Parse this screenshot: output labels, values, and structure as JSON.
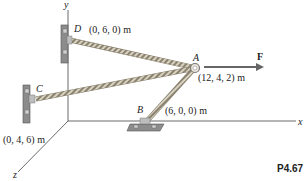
{
  "diagram": {
    "problem_number": "P4.67",
    "axes": {
      "x": "x",
      "y": "y",
      "z": "z"
    },
    "points": {
      "A": {
        "label": "A",
        "coords": "(12, 4, 2) m"
      },
      "B": {
        "label": "B",
        "coords": "(6, 0, 0) m"
      },
      "C": {
        "label": "C",
        "coords": "(0, 4, 6) m"
      },
      "D": {
        "label": "D",
        "coords": "(0, 6, 0) m"
      }
    },
    "force": {
      "label": "F"
    },
    "colors": {
      "rope": "#c9c2b0",
      "rope_dark": "#8a826f",
      "bracket": "#8c8c8c",
      "axis": "#444444"
    }
  }
}
